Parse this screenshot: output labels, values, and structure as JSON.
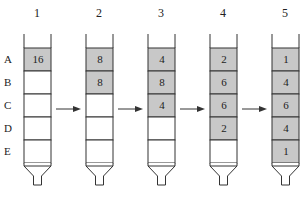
{
  "diagram": {
    "type": "serial-dilution-columns",
    "row_labels": [
      "A",
      "B",
      "C",
      "D",
      "E"
    ],
    "colors": {
      "filled": "#c8c8c8",
      "line": "#333333",
      "empty": "#ffffff"
    },
    "columns": [
      {
        "number": "1",
        "cells": [
          "16",
          "",
          "",
          "",
          ""
        ]
      },
      {
        "number": "2",
        "cells": [
          "8",
          "8",
          "",
          "",
          ""
        ]
      },
      {
        "number": "3",
        "cells": [
          "4",
          "8",
          "4",
          "",
          ""
        ]
      },
      {
        "number": "4",
        "cells": [
          "2",
          "6",
          "6",
          "2",
          ""
        ]
      },
      {
        "number": "5",
        "cells": [
          "1",
          "4",
          "6",
          "4",
          "1"
        ]
      }
    ],
    "arrows": [
      "1→2",
      "2→3",
      "3→4",
      "4→5"
    ]
  }
}
